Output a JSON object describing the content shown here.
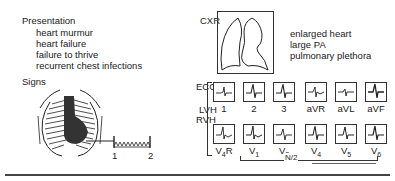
{
  "presentation": {
    "heading": "Presentation",
    "items": [
      "heart murmur",
      "heart failure",
      "failure to thrive",
      "recurrent chest infections"
    ]
  },
  "signs": {
    "heading": "Signs",
    "murmur_markers": [
      "1",
      "2"
    ]
  },
  "cxr": {
    "label": "CXR",
    "findings": [
      "enlarged heart",
      "large PA",
      "pulmonary plethora"
    ]
  },
  "ecg": {
    "label": "ECG",
    "lvh_label": "LVH",
    "rvh_label": "RVH",
    "limb_leads": [
      "1",
      "2",
      "3",
      "aVR",
      "aVL",
      "aVF"
    ],
    "chest_leads": [
      {
        "base": "V",
        "sub": "4",
        "suffix": "R"
      },
      {
        "base": "V",
        "sub": "1",
        "suffix": ""
      },
      {
        "base": "V",
        "sub": "2",
        "suffix": ""
      },
      {
        "base": "V",
        "sub": "4",
        "suffix": ""
      },
      {
        "base": "V",
        "sub": "5",
        "suffix": ""
      },
      {
        "base": "V",
        "sub": "6",
        "suffix": ""
      }
    ],
    "bracket_label": "N/2"
  }
}
